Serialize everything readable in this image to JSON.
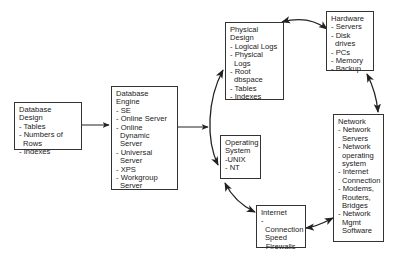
{
  "diagram": {
    "nodes": [
      {
        "id": "database-design",
        "title": "Database\nDesign",
        "items": [
          "- Tables",
          "- Numbers of Rows",
          "- Indexes"
        ]
      },
      {
        "id": "database-engine",
        "title": "Database\nEngine",
        "items": [
          "- SE",
          "- Online Server",
          "- Online Dynamic\n  Server",
          "- Universal\n  Server",
          "- XPS",
          "- Workgroup\n  Server"
        ]
      },
      {
        "id": "physical-design",
        "title": "Physical\nDesign",
        "items": [
          "- Logical Logs",
          "- Physical Logs",
          "- Root dbspace",
          "- Tables",
          "- Indexes"
        ]
      },
      {
        "id": "hardware",
        "title": "Hardware",
        "items": [
          "- Servers",
          "- Disk drives",
          "- PCs",
          "- Memory",
          "- Backup"
        ]
      },
      {
        "id": "operating-system",
        "title": "Operating\nSystem",
        "items": [
          "-UNIX",
          "- NT"
        ]
      },
      {
        "id": "internet",
        "title": "Internet",
        "items": [
          "- Connection\n  Speed",
          "- Firewalls"
        ]
      },
      {
        "id": "network",
        "title": "Network",
        "items": [
          "- Network\n  Servers",
          "- Network\n  operating\n  system",
          "- Internet\n  Connection",
          "- Modems,\n  Routers,\n  Bridges",
          "- Network\n  Mgmt\n  Software"
        ]
      }
    ],
    "edges": [
      {
        "from": "database-design",
        "to": "database-engine",
        "type": "directed"
      },
      {
        "from": "database-engine",
        "to": "left-arc",
        "type": "directed"
      },
      {
        "from": "operating-system",
        "to": "physical-design",
        "type": "bidirectional-arc"
      },
      {
        "from": "physical-design",
        "to": "hardware",
        "type": "bidirectional-arc"
      },
      {
        "from": "hardware",
        "to": "network",
        "type": "bidirectional-arc"
      },
      {
        "from": "network",
        "to": "internet",
        "type": "bidirectional-arc"
      },
      {
        "from": "internet",
        "to": "operating-system",
        "type": "bidirectional-arc"
      }
    ],
    "colors": {
      "line": "#222222",
      "border": "#333333",
      "background": "#ffffff",
      "text": "#222222"
    }
  }
}
